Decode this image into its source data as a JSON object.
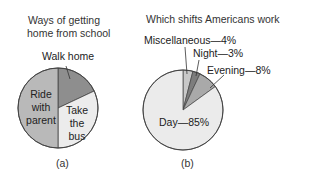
{
  "chart_data": [
    {
      "type": "pie",
      "title": "Ways of getting home from school",
      "caption": "(a)",
      "categories": [
        "Walk home",
        "Take the bus",
        "Ride with parent"
      ],
      "values": [
        18,
        32,
        50
      ],
      "colors": [
        "#8e8e8e",
        "#ececec",
        "#b9b9b9"
      ],
      "start_angle_deg": 0,
      "direction": "clockwise",
      "labels_shown_without_values": true
    },
    {
      "type": "pie",
      "title": "Which shifts Americans work",
      "caption": "(b)",
      "categories": [
        "Miscellaneous",
        "Night",
        "Evening",
        "Day"
      ],
      "values": [
        4,
        3,
        8,
        85
      ],
      "value_labels": [
        "Miscellaneous—4%",
        "Night—3%",
        "Evening—8%",
        "Day—85%"
      ],
      "colors": [
        "#c8c8c8",
        "#7d7d7d",
        "#a9a9a9",
        "#ebebeb"
      ],
      "start_angle_deg": 0,
      "direction": "clockwise",
      "unit": "%"
    }
  ],
  "chart_a": {
    "title_line1": "Ways of getting",
    "title_line2": "home from school",
    "label_walk": "Walk home",
    "label_ride_1": "Ride",
    "label_ride_2": "with",
    "label_ride_3": "parent",
    "label_bus_1": "Take",
    "label_bus_2": "the",
    "label_bus_3": "bus",
    "caption": "(a)"
  },
  "chart_b": {
    "title": "Which shifts Americans work",
    "label_misc": "Miscellaneous—4%",
    "label_night": "Night—3%",
    "label_evening": "Evening—8%",
    "label_day": "Day—85%",
    "caption": "(b)"
  }
}
